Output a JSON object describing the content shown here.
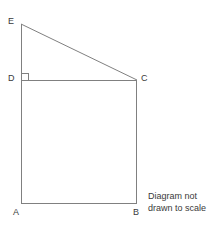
{
  "figure": {
    "kind": "geometry-diagram",
    "canvas": {
      "width": 218,
      "height": 227,
      "background": "#ffffff"
    },
    "stroke": {
      "color": "#808080",
      "width": 1
    },
    "label_color": "#3a3a3a",
    "vertices": [
      {
        "id": "E",
        "label": "E",
        "x": 21,
        "y": 24,
        "label_x": 8,
        "label_y": 18
      },
      {
        "id": "D",
        "label": "D",
        "x": 21,
        "y": 80,
        "label_x": 8,
        "label_y": 74
      },
      {
        "id": "C",
        "label": "C",
        "x": 137,
        "y": 80,
        "label_x": 141,
        "label_y": 74
      },
      {
        "id": "A",
        "label": "A",
        "x": 21,
        "y": 203,
        "label_x": 12,
        "label_y": 208
      },
      {
        "id": "B",
        "label": "B",
        "x": 137,
        "y": 203,
        "label_x": 133,
        "label_y": 208
      }
    ],
    "segments": [
      {
        "id": "EC",
        "from": "E",
        "to": "C",
        "x1": 21,
        "y1": 24,
        "x2": 137,
        "y2": 80
      },
      {
        "id": "EA",
        "from": "E",
        "to": "A",
        "x1": 21,
        "y1": 24,
        "x2": 21,
        "y2": 203
      },
      {
        "id": "DC",
        "from": "D",
        "to": "C",
        "x1": 21,
        "y1": 80,
        "x2": 137,
        "y2": 80
      },
      {
        "id": "AB",
        "from": "A",
        "to": "B",
        "x1": 21,
        "y1": 203,
        "x2": 137,
        "y2": 203
      },
      {
        "id": "BC",
        "from": "B",
        "to": "C",
        "x1": 137,
        "y1": 203,
        "x2": 137,
        "y2": 80
      }
    ],
    "right_angle": {
      "at": "D",
      "between": [
        "DE",
        "DC"
      ],
      "size": 7,
      "path": "M 21 73 L 28 73 L 28 80"
    },
    "caption": {
      "line1": "Diagram not",
      "line2": "drawn to scale"
    }
  },
  "labels": {
    "E": "E",
    "D": "D",
    "C": "C",
    "A": "A",
    "B": "B"
  },
  "caption": {
    "line1": "Diagram not",
    "line2": "drawn to scale"
  }
}
